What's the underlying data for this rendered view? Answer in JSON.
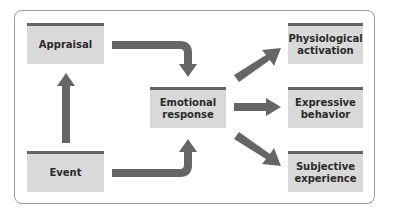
{
  "diagram": {
    "type": "flowchart",
    "colors": {
      "box_fill": "#d9d9d9",
      "box_top_bar": "#666666",
      "arrow": "#666666",
      "frame_border": "#9a9a9a"
    },
    "nodes": {
      "appraisal": {
        "label": "Appraisal"
      },
      "event": {
        "label": "Event"
      },
      "emotional_response": {
        "label": "Emotional\nresponse"
      },
      "physiological_activation": {
        "label": "Physiological\nactivation"
      },
      "expressive_behavior": {
        "label": "Expressive\nbehavior"
      },
      "subjective_experience": {
        "label": "Subjective\nexperience"
      }
    },
    "edges": [
      {
        "from": "event",
        "to": "appraisal"
      },
      {
        "from": "appraisal",
        "to": "emotional_response"
      },
      {
        "from": "event",
        "to": "emotional_response"
      },
      {
        "from": "emotional_response",
        "to": "physiological_activation"
      },
      {
        "from": "emotional_response",
        "to": "expressive_behavior"
      },
      {
        "from": "emotional_response",
        "to": "subjective_experience"
      }
    ]
  }
}
